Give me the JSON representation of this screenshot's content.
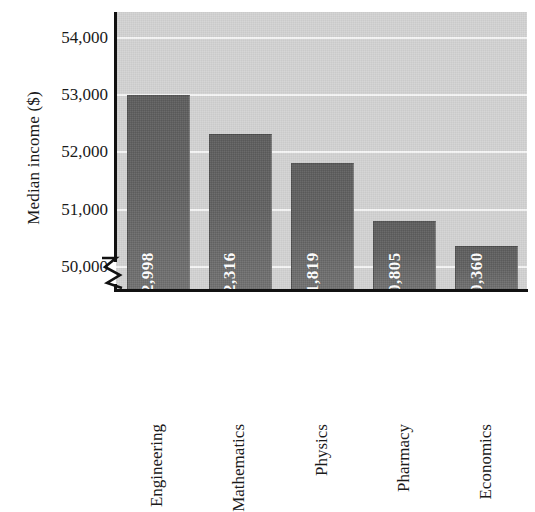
{
  "chart_data": {
    "type": "bar",
    "title": "",
    "xlabel": "",
    "ylabel": "Median income ($)",
    "categories": [
      "Engineering",
      "Mathematics",
      "Physics",
      "Pharmacy",
      "Economics"
    ],
    "values": [
      52998,
      52316,
      51819,
      50805,
      50360
    ],
    "value_labels": [
      "52,998",
      "52,316",
      "51,819",
      "50,805",
      "50,360"
    ],
    "ytick_values": [
      50000,
      51000,
      52000,
      53000,
      54000
    ],
    "ytick_labels": [
      "50,000",
      "51,000",
      "52,000",
      "53,000",
      "54,000"
    ],
    "ylim": [
      49600,
      54450
    ],
    "axis_break": true,
    "axis_break_note": "y-axis broken below 50,000",
    "grid": true,
    "grid_axis": "y",
    "legend": "none",
    "colors": {
      "bar": "#5e5e5e",
      "plot_background": "#d2d2d2",
      "gridline": "#f6f6f6",
      "axis": "#111111",
      "value_label_text": "#ffffff",
      "tick_text": "#1a1a1a"
    }
  }
}
